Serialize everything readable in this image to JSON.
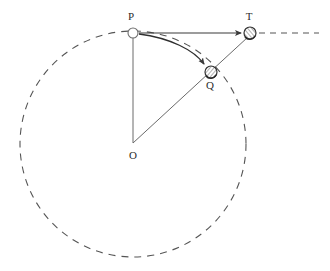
{
  "figure": {
    "background_color": "#ffffff",
    "stroke_color": "#4a4a4a",
    "label_color": "#2b2b2b",
    "width": 330,
    "height": 271
  },
  "points": [
    {
      "id": "O",
      "label": "O",
      "x": 133,
      "y": 144,
      "label_x": 133,
      "label_y": 159,
      "marker": "none",
      "role": "center-of-circle"
    },
    {
      "id": "P",
      "label": "P",
      "x": 133,
      "y": 33,
      "label_x": 131,
      "label_y": 20,
      "marker": "open-circle",
      "radius": 5,
      "role": "launch-point"
    },
    {
      "id": "Q",
      "label": "Q",
      "x": 211,
      "y": 72,
      "label_x": 210,
      "label_y": 89,
      "marker": "shaded-circle",
      "radius": 6,
      "role": "landing-point-on-surface"
    },
    {
      "id": "T",
      "label": "T",
      "x": 250,
      "y": 33,
      "label_x": 249,
      "label_y": 20,
      "marker": "shaded-circle",
      "radius": 6,
      "role": "tangent-target-point"
    }
  ],
  "circle": {
    "name": "surface-circle",
    "center_x": 133,
    "center_y": 144,
    "radius": 113,
    "style": "dashed",
    "dash_pattern": "7 6",
    "stroke_width": 1.1
  },
  "segments": [
    {
      "name": "radius-o-to-p",
      "from": "O",
      "to": "P",
      "style": "solid",
      "arrow": false
    },
    {
      "name": "ray-o-to-t-through-q",
      "from": "O",
      "to": "T",
      "style": "solid",
      "arrow": false
    }
  ],
  "arrows": [
    {
      "name": "arrow-p-to-t",
      "from": "P",
      "to": "T",
      "style": "straight",
      "label": "",
      "description": "horizontal straight arrow from P to T"
    },
    {
      "name": "arrow-p-to-q-curved",
      "from": "P",
      "to": "Q",
      "style": "curved",
      "label": "",
      "description": "curved trajectory arrow from P down to Q"
    }
  ],
  "dashed_extension": {
    "name": "tangent-extension-line",
    "from_x": 258,
    "from_y": 33,
    "to_x": 319,
    "to_y": 33,
    "style": "dashed",
    "dash_pattern": "6 5"
  }
}
